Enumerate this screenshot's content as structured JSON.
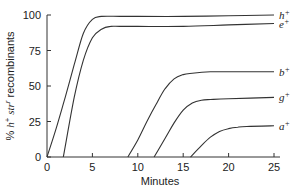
{
  "chart_data": {
    "type": "line",
    "title": "",
    "xlabel": "Minutes",
    "ylabel": "% h+ str^r recombinants",
    "xlim": [
      0,
      25
    ],
    "ylim": [
      0,
      100
    ],
    "xticks": [
      0,
      5,
      10,
      15,
      20,
      25
    ],
    "yticks": [
      0,
      25,
      50,
      75,
      100
    ],
    "grid": false,
    "legend_position": "right-end labels",
    "series": [
      {
        "name": "h+",
        "base": "h",
        "x": [
          0,
          1,
          2,
          3,
          4,
          5,
          6,
          8,
          10,
          15,
          20,
          25
        ],
        "values": [
          0,
          20,
          42,
          65,
          87,
          97,
          99,
          99,
          99,
          99,
          99.5,
          100
        ]
      },
      {
        "name": "e+",
        "base": "e",
        "x": [
          1.8,
          3,
          4,
          5,
          6,
          7,
          8,
          10,
          15,
          20,
          25
        ],
        "values": [
          0,
          42,
          68,
          84,
          90,
          92,
          92,
          92,
          92,
          93,
          94
        ]
      },
      {
        "name": "b+",
        "base": "b",
        "x": [
          8.9,
          10,
          11,
          12,
          13,
          14,
          15,
          16,
          18,
          20,
          25
        ],
        "values": [
          0,
          12,
          25,
          37,
          48,
          55,
          58,
          59,
          60,
          60,
          60
        ]
      },
      {
        "name": "g+",
        "base": "g",
        "x": [
          11.8,
          13,
          14,
          15,
          16,
          17,
          18,
          20,
          25
        ],
        "values": [
          0,
          13,
          24,
          33,
          38,
          40,
          40.5,
          41,
          42
        ]
      },
      {
        "name": "a+",
        "base": "a",
        "x": [
          15.8,
          17,
          18,
          19,
          20,
          21,
          22,
          25
        ],
        "values": [
          0,
          8,
          14,
          18,
          20,
          21,
          21.5,
          22
        ]
      }
    ]
  },
  "labels": {
    "xlabel": "Minutes",
    "ylabel_prefix": "% ",
    "ylabel_h": "h",
    "ylabel_plus": "+",
    "ylabel_str": " str",
    "ylabel_r": "r",
    "ylabel_suffix": " recombinants"
  }
}
